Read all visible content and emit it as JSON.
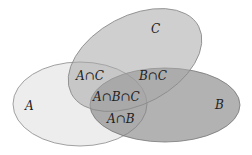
{
  "diagram": {
    "type": "venn",
    "sets": [
      {
        "id": "A",
        "label": "A",
        "fill": "#ebebeb"
      },
      {
        "id": "B",
        "label": "B",
        "fill": "#9a9a9a"
      },
      {
        "id": "C",
        "label": "C",
        "fill": "#bdbdbd"
      }
    ],
    "regions": {
      "a_c": "A∩C",
      "b_c": "B∩C",
      "a_b_c": "A∩B∩C",
      "a_b": "A∩B"
    },
    "stroke": "#8a8a8a"
  }
}
